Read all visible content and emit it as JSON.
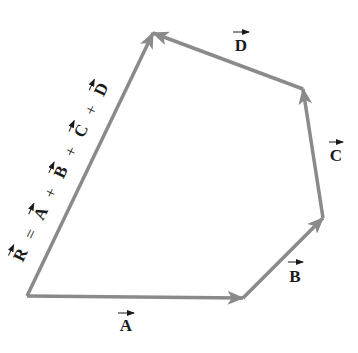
{
  "diagram": {
    "type": "vector-addition-polygon",
    "colors": {
      "vector": "#8a8a8a",
      "text": "#1a1a1a",
      "background": "#ffffff"
    },
    "vectors": [
      {
        "name": "A",
        "label": "A",
        "from": [
          27,
          296
        ],
        "to": [
          243,
          298
        ]
      },
      {
        "name": "B",
        "label": "B",
        "from": [
          243,
          298
        ],
        "to": [
          323,
          218
        ]
      },
      {
        "name": "C",
        "label": "C",
        "from": [
          323,
          218
        ],
        "to": [
          303,
          89
        ]
      },
      {
        "name": "D",
        "label": "D",
        "from": [
          303,
          89
        ],
        "to": [
          153,
          33
        ]
      },
      {
        "name": "R",
        "label": "R",
        "from": [
          27,
          296
        ],
        "to": [
          153,
          33
        ]
      }
    ],
    "resultant_equation": {
      "terms": [
        "R",
        "=",
        "A",
        "+",
        "B",
        "+",
        "C",
        "+",
        "D"
      ]
    },
    "labels": {
      "A": "A",
      "B": "B",
      "C": "C",
      "D": "D",
      "R": "R",
      "eq": "=",
      "plus": "+"
    }
  }
}
